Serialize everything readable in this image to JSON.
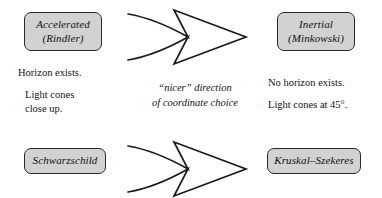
{
  "diagram": {
    "colors": {
      "box_fill": "#d2d2d2",
      "box_border": "#2a2a2a",
      "arrow_stroke": "#1a1a1a",
      "text": "#141414",
      "background": "#ffffff"
    },
    "nodes": {
      "accelerated": {
        "line1": "Accelerated",
        "line2": "(Rindler)"
      },
      "inertial": {
        "line1": "Inertial",
        "line2": "(Minkowski)"
      },
      "schwarzschild": {
        "line1": "Schwarzschild"
      },
      "kruskal": {
        "line1": "Kruskal–Szekeres"
      }
    },
    "annotations": {
      "left": {
        "line1": "Horizon exists.",
        "line2": "Light cones",
        "line3": "close up."
      },
      "right": {
        "line1": "No horizon exists.",
        "line2": "Light cones at 45°."
      },
      "middle": {
        "line1": "“nicer” direction",
        "line2": "of coordinate choice"
      }
    },
    "arrows": {
      "top_label": "double-tailed arrow pointing right",
      "bottom_label": "double-tailed arrow pointing right"
    }
  }
}
